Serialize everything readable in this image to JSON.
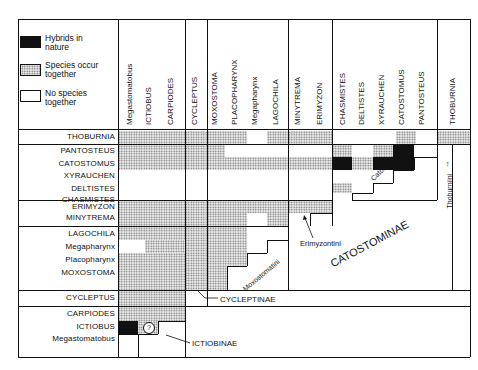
{
  "legend": [
    {
      "key": "hybrids",
      "label_line1": "Hybrids in",
      "label_line2": "nature",
      "fill": "black"
    },
    {
      "key": "cooccur",
      "label_line1": "Species occur",
      "label_line2": "together",
      "fill": "stippled"
    },
    {
      "key": "none",
      "label_line1": "No species",
      "label_line2": "together",
      "fill": "white"
    }
  ],
  "columns": [
    {
      "label": "Megastomatobus",
      "group": "Ictiobinae"
    },
    {
      "label": "ICTIOBUS",
      "group": "Ictiobinae"
    },
    {
      "label": "CARPIODES",
      "group": "Ictiobinae"
    },
    {
      "label": "CYCLEPTUS",
      "group": "Cycleptinae"
    },
    {
      "label": "MOXOSTOMA",
      "group": "Moxostomatini"
    },
    {
      "label": "PLACOPHARYNX",
      "group": "Moxostomatini"
    },
    {
      "label": "Megapharynx",
      "group": "Moxostomatini"
    },
    {
      "label": "LAGOCHILA",
      "group": "Moxostomatini"
    },
    {
      "label": "MINYTREMA",
      "group": "Erimyzontini"
    },
    {
      "label": "ERIMYZON",
      "group": "Erimyzontini"
    },
    {
      "label": "CHASMISTES",
      "group": "Catostomini"
    },
    {
      "label": "DELTISTES",
      "group": "Catostomini"
    },
    {
      "label": "XYRAUCHEN",
      "group": "Catostomini"
    },
    {
      "label": "CATOSTOMUS",
      "group": "Catostomini"
    },
    {
      "label": "PANTOSTEUS",
      "group": "Catostomini"
    },
    {
      "label": "THOBURNIA",
      "group": "Thoburniini"
    }
  ],
  "rows": [
    {
      "label": "THOBURNIA",
      "group": "Thoburniini"
    },
    {
      "label": "PANTOSTEUS",
      "group": "Catostomini"
    },
    {
      "label": "CATOSTOMUS",
      "group": "Catostomini"
    },
    {
      "label": "XYRAUCHEN",
      "group": "Catostomini"
    },
    {
      "label": "DELTISTES",
      "group": "Catostomini"
    },
    {
      "label": "CHASMISTES",
      "group": "Catostomini"
    },
    {
      "label": "ERIMYZON",
      "group": "Erimyzontini"
    },
    {
      "label": "MINYTREMA",
      "group": "Erimyzontini"
    },
    {
      "label": "LAGOCHILA",
      "group": "Moxostomatini"
    },
    {
      "label": "Megapharynx",
      "group": "Moxostomatini"
    },
    {
      "label": "Placopharynx",
      "group": "Moxostomatini"
    },
    {
      "label": "MOXOSTOMA",
      "group": "Moxostomatini"
    },
    {
      "label": "CYCLEPTUS",
      "group": "Cycleptinae"
    },
    {
      "label": "CARPIODES",
      "group": "Ictiobinae"
    },
    {
      "label": "ICTIOBUS",
      "group": "Ictiobinae"
    },
    {
      "label": "Megastomatobus",
      "group": "Ictiobinae"
    }
  ],
  "annotations": {
    "catostominae": "CATOSTOMINAE",
    "catostomini": "Catostomini",
    "thoburniini": "Thoburniini",
    "erimyzontini": "Erimyzontini",
    "moxostomatini": "Moxostomatini",
    "cycleptinae": "CYCLEPTINAE",
    "ictiobinae": "ICTIOBINAE",
    "uncertain_marker": "?"
  }
}
